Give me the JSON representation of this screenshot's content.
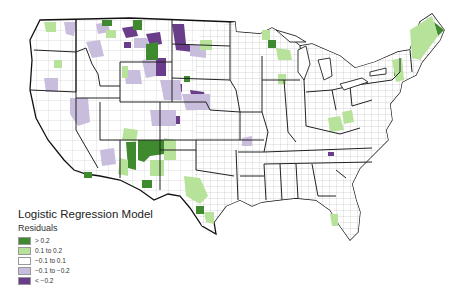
{
  "legend": {
    "title": "Logistic Regression Model",
    "subtitle": "Residuals",
    "items": [
      {
        "label": "> 0.2",
        "color": "#3f8a2e"
      },
      {
        "label": "0.1 to 0.2",
        "color": "#b7e29a"
      },
      {
        "label": "−0.1 to 0.1",
        "color": "#ffffff"
      },
      {
        "label": "−0.1 to −0.2",
        "color": "#c9bddd"
      },
      {
        "label": "< −0.2",
        "color": "#6a3d8a"
      }
    ]
  },
  "map": {
    "region": "Contiguous United States",
    "unit": "County",
    "variable": "Residuals"
  }
}
